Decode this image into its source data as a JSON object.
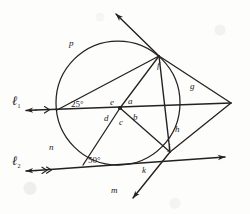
{
  "figure": {
    "background_color": "#fdfdfc",
    "ink_color": "#24211f"
  },
  "lines": {
    "l1": {
      "label": "ℓ",
      "subscript": "1",
      "marks": 1
    },
    "l2": {
      "label": "ℓ",
      "subscript": "2",
      "marks": 2
    }
  },
  "angles": {
    "left_vertex": "25°",
    "lower_left_vertex": "50°"
  },
  "center_angle_labels": {
    "upper_left": "e",
    "upper_right": "a",
    "lower_left": "d",
    "lower_center": "c",
    "lower_right": "b"
  },
  "points": {
    "top_right_on_circle": "f",
    "lower_right_on_circle": "j"
  },
  "arcs": {
    "upper_left": "p",
    "left": "n",
    "bottom": "m",
    "lower_right": "k",
    "right_lower": "h",
    "right_upper": "g"
  },
  "geometry": {
    "circle": {
      "cx": 118,
      "cy": 103,
      "r": 62
    },
    "center_point": {
      "x": 120,
      "y": 108
    },
    "point_f": {
      "x": 159,
      "y": 56
    },
    "point_j": {
      "x": 170,
      "y": 152
    },
    "right_vertex": {
      "x": 231,
      "y": 103
    },
    "left_on_circle": {
      "x": 57,
      "y": 110
    },
    "lower_left_on_circle": {
      "x": 83,
      "y": 165
    }
  }
}
